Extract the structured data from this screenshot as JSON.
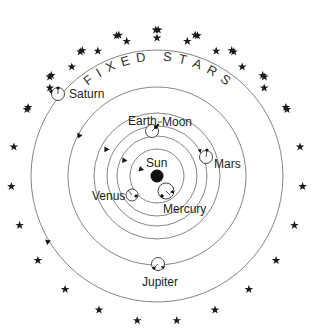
{
  "title_letters": [
    "F",
    "I",
    "X",
    "E",
    "D",
    " ",
    "S",
    "T",
    "A",
    "R",
    "S"
  ],
  "center": {
    "label": "Sun",
    "x": 157,
    "y": 177
  },
  "colors": {
    "line": "#777777",
    "ink": "#1a1a1a",
    "background": "#ffffff"
  },
  "bodies": [
    {
      "name": "Mercury",
      "label": "Mercury"
    },
    {
      "name": "Venus",
      "label": "Venus"
    },
    {
      "name": "Earth",
      "label": "Earth"
    },
    {
      "name": "Moon",
      "label": "Moon"
    },
    {
      "name": "Mars",
      "label": "Mars"
    },
    {
      "name": "Jupiter",
      "label": "Jupiter"
    },
    {
      "name": "Saturn",
      "label": "Saturn"
    }
  ],
  "labels": {
    "sun": "Sun",
    "mercury": "Mercury",
    "venus": "Venus",
    "earth": "Earth",
    "moon": "Moon",
    "mars": "Mars",
    "jupiter": "Jupiter",
    "saturn": "Saturn"
  },
  "star_count": 32
}
